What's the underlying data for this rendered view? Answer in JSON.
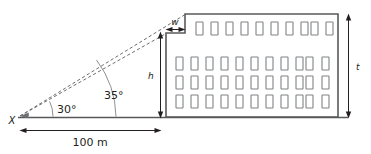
{
  "figure": {
    "observer_point_label": "X",
    "baseline_label": "100 m",
    "angles": [
      {
        "id": "lower",
        "label": "30°",
        "value": 30,
        "unit": "degrees",
        "target": "height-h-top"
      },
      {
        "id": "upper",
        "label": "35°",
        "value": 35,
        "unit": "degrees",
        "target": "building-top"
      }
    ],
    "dimensions": [
      {
        "id": "baseline",
        "label": "100 m",
        "value": "100",
        "unit": "m",
        "orientation": "horizontal"
      },
      {
        "id": "height-h",
        "label": "h",
        "orientation": "vertical"
      },
      {
        "id": "setback-w",
        "label": "w",
        "orientation": "horizontal"
      },
      {
        "id": "total-height-t",
        "label": "t",
        "orientation": "vertical"
      }
    ],
    "colors": {
      "ink": "#231f20",
      "outline": "#58595b",
      "window_stroke": "#808285",
      "dashed": "#6d6e71",
      "background": "#ffffff"
    },
    "building": {
      "window_rows": [
        {
          "row": 1,
          "count": 10
        },
        {
          "row": 2,
          "count": 11
        },
        {
          "row": 3,
          "count": 11
        },
        {
          "row": 4,
          "count": 11
        }
      ]
    }
  }
}
